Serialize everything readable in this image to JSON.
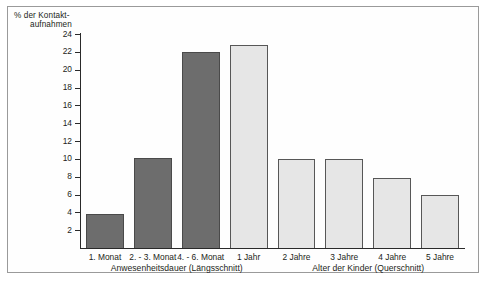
{
  "axis_title": {
    "line1": "% der Kontakt-",
    "line2": "aufnahmen"
  },
  "groups": {
    "left_label": "Anwesenheitsdauer (Längsschnitt)",
    "right_label": "Alter der Kinder (Querschnitt)"
  },
  "colors": {
    "dark_bar": "#6d6d6d",
    "light_bar": "#e6e6e6",
    "bar_outline": "#4a4a4a",
    "axis": "#2a2a2a",
    "frame": "#9a9a9a",
    "text": "#231f20"
  },
  "chart_data": {
    "type": "bar",
    "title": "",
    "xlabel": "",
    "ylabel": "% der Kontaktaufnahmen",
    "ylim": [
      0,
      24
    ],
    "ytick_step": 2,
    "yticks": [
      2,
      4,
      6,
      8,
      10,
      12,
      14,
      16,
      18,
      20,
      22,
      24
    ],
    "ytick_labels": [
      "2",
      "4",
      "6",
      "8",
      "10",
      "12",
      "14",
      "16",
      "18",
      "20",
      "22",
      "24"
    ],
    "grid": false,
    "legend": "none",
    "categories": [
      "1. Monat",
      "2. - 3. Monat",
      "4. - 6. Monat",
      "1 Jahr",
      "2 Jahre",
      "3 Jahre",
      "4 Jahre",
      "5 Jahre"
    ],
    "values": [
      3.9,
      10.2,
      22.1,
      22.9,
      10.1,
      10.1,
      8.0,
      6.1
    ],
    "bar_styles": [
      "dark",
      "dark",
      "dark",
      "light",
      "light",
      "light",
      "light",
      "light"
    ],
    "group_labels": [
      "Anwesenheitsdauer (Längsschnitt)",
      "Alter der Kinder (Querschnitt)"
    ],
    "group_spans": [
      [
        0,
        3
      ],
      [
        4,
        7
      ]
    ]
  }
}
